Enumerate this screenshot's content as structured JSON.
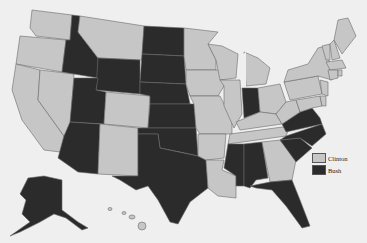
{
  "title": "",
  "colors": {
    "background": "#efefef",
    "clinton": "#c6c6c6",
    "bush": "#2b2b2b",
    "border": "#6a6a6a"
  },
  "legend": [
    {
      "label": "Clinton",
      "color": "#c6c6c6"
    },
    {
      "label": "Bush",
      "color": "#2b2b2b"
    }
  ],
  "states": {
    "clinton": [
      "WA",
      "OR",
      "CA",
      "NV",
      "MT",
      "CO",
      "NM",
      "MN",
      "WI",
      "IA",
      "MO",
      "AR",
      "LA",
      "TN",
      "KY",
      "IL",
      "MI",
      "OH",
      "PA",
      "WV",
      "MD",
      "DE",
      "NJ",
      "NY",
      "CT",
      "RI",
      "MA",
      "VT",
      "NH",
      "ME",
      "GA",
      "HI"
    ],
    "bush": [
      "ID",
      "WY",
      "UT",
      "AZ",
      "ND",
      "SD",
      "NE",
      "KS",
      "OK",
      "TX",
      "IN",
      "VA",
      "NC",
      "SC",
      "AL",
      "MS",
      "FL",
      "AK"
    ]
  }
}
